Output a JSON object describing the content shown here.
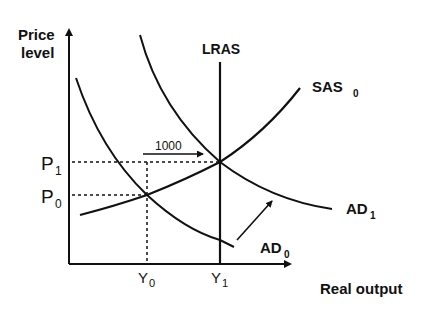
{
  "diagram": {
    "type": "AD-AS model",
    "y_axis_label_line1": "Price",
    "y_axis_label_line2": "level",
    "x_axis_label": "Real output",
    "curves": {
      "lras": "LRAS",
      "sas0_main": "SAS",
      "sas0_sub": "0",
      "ad0_main": "AD",
      "ad0_sub": "0",
      "ad1_main": "AD",
      "ad1_sub": "1"
    },
    "price_levels": {
      "p1_main": "P",
      "p1_sub": "1",
      "p0_main": "P",
      "p0_sub": "0"
    },
    "output_levels": {
      "y0_main": "Y",
      "y0_sub": "0",
      "y1_main": "Y",
      "y1_sub": "1"
    },
    "annotation": "1000",
    "colors": {
      "ink": "#111111",
      "background": "#ffffff"
    }
  }
}
